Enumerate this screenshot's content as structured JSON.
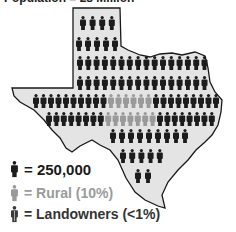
{
  "title": "Population = 28 Million",
  "colors": {
    "map_fill": "#e4e4e4",
    "map_stroke": "#1a1a1a",
    "person": "#1c1c1c",
    "rural": "#9a9a9a",
    "landowner": "#3a3a3a"
  },
  "rows": [
    {
      "segments": [
        {
          "type": "person",
          "count": 4
        }
      ]
    },
    {
      "segments": [
        {
          "type": "person",
          "count": 5
        }
      ]
    },
    {
      "segments": [
        {
          "type": "person",
          "count": 16
        }
      ]
    },
    {
      "segments": [
        {
          "type": "person",
          "count": 16
        }
      ]
    },
    {
      "segments": [
        {
          "type": "person",
          "count": 10
        },
        {
          "type": "rural",
          "count": 6
        },
        {
          "type": "person",
          "count": 9
        }
      ]
    },
    {
      "segments": [
        {
          "type": "person",
          "count": 8
        },
        {
          "type": "rural",
          "count": 7
        },
        {
          "type": "person",
          "count": 8
        }
      ]
    },
    {
      "segments": [
        {
          "type": "person",
          "count": 9
        }
      ]
    },
    {
      "segments": [
        {
          "type": "person",
          "count": 5
        }
      ]
    },
    {
      "segments": [
        {
          "type": "person",
          "count": 2
        }
      ]
    }
  ],
  "legend": [
    {
      "type": "person",
      "label": "= 250,000"
    },
    {
      "type": "rural",
      "label": "= Rural (10%)"
    },
    {
      "type": "landowner",
      "label": "= Landowners (<1%)"
    }
  ]
}
